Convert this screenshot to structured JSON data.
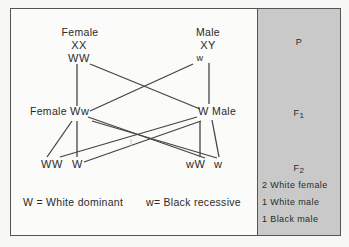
{
  "diagram": {
    "type": "genetics-cross",
    "parents": {
      "female": {
        "label": "Female",
        "chromosomes": "XX",
        "genotype": "WW"
      },
      "male": {
        "label": "Male",
        "chromosomes": "XY",
        "genotype": "w"
      }
    },
    "f1": {
      "female": {
        "label": "Female",
        "genotype": "Ww"
      },
      "male": {
        "genotype": "W",
        "label": "Male"
      }
    },
    "f2": {
      "offspring": [
        "WW",
        "W",
        "wW",
        "w"
      ]
    },
    "legend": {
      "dominant": "W = White dominant",
      "recessive": "w= Black recessive"
    },
    "generations_panel": {
      "p": "P",
      "f1": {
        "base": "F",
        "sub": "1"
      },
      "f2": {
        "base": "F",
        "sub": "2"
      },
      "f2_results": [
        "2 White female",
        "1 White male",
        "1 Black male"
      ]
    },
    "colors": {
      "panel": "#c9c9c9",
      "line": "#444444",
      "text": "#2a2a2a"
    }
  }
}
